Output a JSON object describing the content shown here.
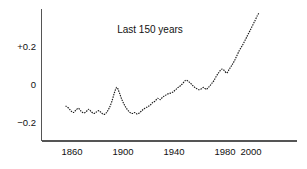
{
  "chart_data": {
    "type": "line",
    "title": "Last 150 years",
    "xlabel": "",
    "ylabel": "",
    "xlim": [
      1853,
      2007
    ],
    "ylim": [
      -0.32,
      0.42
    ],
    "grid": false,
    "legend": null,
    "x_ticks": [
      "1860",
      "1900",
      "1940",
      "1980",
      "2000"
    ],
    "x_tick_values": [
      1860,
      1900,
      1940,
      1980,
      2000
    ],
    "y_ticks": [
      "+0.2",
      "0",
      "−0.2"
    ],
    "y_tick_values": [
      0.2,
      0,
      -0.2
    ],
    "line_style": "dotted",
    "series": [
      {
        "name": "Temperature anomaly",
        "x": [
          1855,
          1857,
          1859,
          1861,
          1863,
          1865,
          1867,
          1869,
          1871,
          1873,
          1875,
          1877,
          1879,
          1881,
          1883,
          1885,
          1887,
          1889,
          1891,
          1893,
          1895,
          1897,
          1899,
          1901,
          1903,
          1905,
          1907,
          1909,
          1911,
          1913,
          1915,
          1917,
          1919,
          1921,
          1923,
          1925,
          1927,
          1929,
          1931,
          1933,
          1935,
          1937,
          1939,
          1941,
          1943,
          1945,
          1947,
          1949,
          1951,
          1953,
          1955,
          1957,
          1959,
          1961,
          1963,
          1965,
          1967,
          1969,
          1971,
          1973,
          1975,
          1977,
          1979,
          1981,
          1983,
          1985,
          1987,
          1989,
          1991,
          1993,
          1995,
          1997,
          1999,
          2001,
          2003,
          2005,
          2006
        ],
        "values": [
          -0.115,
          -0.125,
          -0.14,
          -0.15,
          -0.138,
          -0.128,
          -0.142,
          -0.152,
          -0.146,
          -0.133,
          -0.145,
          -0.155,
          -0.148,
          -0.14,
          -0.152,
          -0.16,
          -0.15,
          -0.128,
          -0.095,
          -0.05,
          -0.018,
          -0.045,
          -0.082,
          -0.11,
          -0.132,
          -0.148,
          -0.155,
          -0.15,
          -0.158,
          -0.15,
          -0.138,
          -0.128,
          -0.12,
          -0.112,
          -0.098,
          -0.09,
          -0.075,
          -0.082,
          -0.068,
          -0.06,
          -0.052,
          -0.048,
          -0.042,
          -0.03,
          -0.018,
          -0.008,
          0.006,
          0.02,
          0.014,
          0.002,
          -0.012,
          -0.022,
          -0.03,
          -0.026,
          -0.018,
          -0.028,
          -0.016,
          0.0,
          0.018,
          0.042,
          0.062,
          0.078,
          0.072,
          0.058,
          0.078,
          0.098,
          0.122,
          0.15,
          0.178,
          0.2,
          0.225,
          0.252,
          0.278,
          0.305,
          0.332,
          0.36,
          0.372
        ]
      }
    ]
  },
  "axes": {
    "y_axis_name": "y-axis",
    "x_axis_name": "x-axis"
  }
}
